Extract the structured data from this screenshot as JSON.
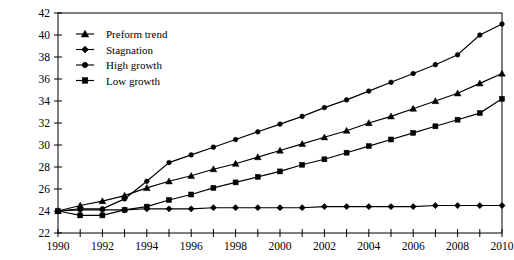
{
  "chart_data": {
    "type": "line",
    "title": "",
    "xlabel": "",
    "ylabel": "",
    "x": [
      1990,
      1991,
      1992,
      1993,
      1994,
      1995,
      1996,
      1997,
      1998,
      1999,
      2000,
      2001,
      2002,
      2003,
      2004,
      2005,
      2006,
      2007,
      2008,
      2009,
      2010
    ],
    "xlim": [
      1990,
      2010
    ],
    "ylim": [
      22,
      42
    ],
    "y_ticks": [
      22,
      24,
      26,
      28,
      30,
      32,
      34,
      36,
      38,
      40,
      42
    ],
    "x_ticks": [
      1990,
      1991,
      1992,
      1993,
      1994,
      1995,
      1996,
      1997,
      1998,
      1999,
      2000,
      2001,
      2002,
      2003,
      2004,
      2005,
      2006,
      2007,
      2008,
      2009,
      2010
    ],
    "x_tick_labels": [
      "1990",
      "",
      "1992",
      "",
      "1994",
      "",
      "1996",
      "",
      "1998",
      "",
      "2000",
      "",
      "2002",
      "",
      "2004",
      "",
      "2006",
      "",
      "2008",
      "",
      "2010"
    ],
    "y_tick_labels": [
      "22",
      "24",
      "26",
      "28",
      "30",
      "32",
      "34",
      "36",
      "38",
      "40",
      "42"
    ],
    "grid": false,
    "legend_position": "top-left",
    "series": [
      {
        "name": "Preform trend",
        "marker": "triangle",
        "values": [
          24.0,
          24.5,
          24.9,
          25.4,
          26.1,
          26.7,
          27.2,
          27.8,
          28.3,
          28.9,
          29.5,
          30.1,
          30.7,
          31.3,
          32.0,
          32.6,
          33.3,
          34.0,
          34.7,
          35.6,
          36.5
        ]
      },
      {
        "name": "Stagnation",
        "marker": "diamond",
        "values": [
          24.0,
          24.1,
          24.1,
          24.1,
          24.2,
          24.2,
          24.2,
          24.3,
          24.3,
          24.3,
          24.3,
          24.3,
          24.4,
          24.4,
          24.4,
          24.4,
          24.4,
          24.5,
          24.5,
          24.5,
          24.5
        ]
      },
      {
        "name": "High growth",
        "marker": "circle",
        "values": [
          24.0,
          24.2,
          24.2,
          25.1,
          26.7,
          28.4,
          29.1,
          29.8,
          30.5,
          31.2,
          31.9,
          32.6,
          33.4,
          34.1,
          34.9,
          35.7,
          36.5,
          37.3,
          38.2,
          40.0,
          41.0
        ]
      },
      {
        "name": "Low growth",
        "marker": "square",
        "values": [
          24.0,
          23.6,
          23.6,
          24.1,
          24.4,
          25.0,
          25.5,
          26.1,
          26.6,
          27.1,
          27.6,
          28.2,
          28.7,
          29.3,
          29.9,
          30.5,
          31.1,
          31.7,
          32.3,
          32.9,
          34.2
        ]
      }
    ]
  },
  "legend": {
    "items": [
      {
        "label": "Preform trend",
        "marker": "triangle"
      },
      {
        "label": "Stagnation",
        "marker": "diamond"
      },
      {
        "label": "High growth",
        "marker": "circle"
      },
      {
        "label": "Low growth",
        "marker": "square"
      }
    ]
  }
}
